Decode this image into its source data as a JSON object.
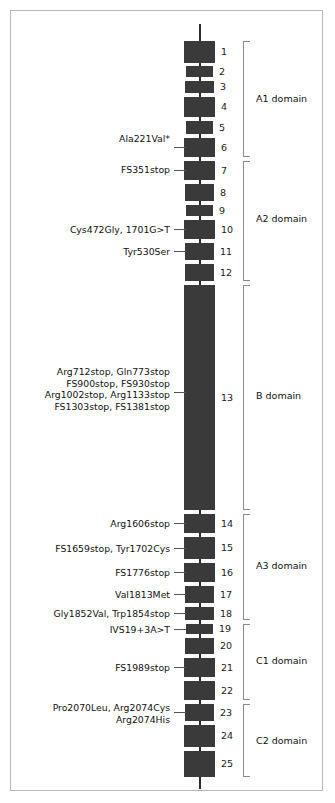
{
  "figure": {
    "backbone_color": "#2b2b2b",
    "exon_color": "#3a3a3a",
    "bracket_color": "#8a8a8a",
    "frame_color": "#b8b8b8"
  },
  "exons": [
    {
      "number": "1",
      "top": 41,
      "height": 22,
      "left": 184,
      "width": 31
    },
    {
      "number": "2",
      "top": 66,
      "height": 11,
      "left": 186,
      "width": 27
    },
    {
      "number": "3",
      "top": 81,
      "height": 12,
      "left": 185,
      "width": 29
    },
    {
      "number": "4",
      "top": 97,
      "height": 20,
      "left": 184,
      "width": 31
    },
    {
      "number": "5",
      "top": 121,
      "height": 13,
      "left": 186,
      "width": 27
    },
    {
      "number": "6",
      "top": 138,
      "height": 19,
      "left": 184,
      "width": 31
    },
    {
      "number": "7",
      "top": 161,
      "height": 19,
      "left": 184,
      "width": 31
    },
    {
      "number": "8",
      "top": 184,
      "height": 17,
      "left": 185,
      "width": 29
    },
    {
      "number": "9",
      "top": 205,
      "height": 11,
      "left": 186,
      "width": 27
    },
    {
      "number": "10",
      "top": 220,
      "height": 19,
      "left": 184,
      "width": 31
    },
    {
      "number": "11",
      "top": 243,
      "height": 17,
      "left": 185,
      "width": 29
    },
    {
      "number": "12",
      "top": 264,
      "height": 17,
      "left": 185,
      "width": 29
    },
    {
      "number": "13",
      "top": 285,
      "height": 225,
      "left": 184,
      "width": 31
    },
    {
      "number": "14",
      "top": 514,
      "height": 19,
      "left": 184,
      "width": 31
    },
    {
      "number": "15",
      "top": 537,
      "height": 22,
      "left": 184,
      "width": 31
    },
    {
      "number": "16",
      "top": 563,
      "height": 19,
      "left": 184,
      "width": 31
    },
    {
      "number": "17",
      "top": 586,
      "height": 17,
      "left": 185,
      "width": 29
    },
    {
      "number": "18",
      "top": 607,
      "height": 13,
      "left": 185,
      "width": 29
    },
    {
      "number": "19",
      "top": 624,
      "height": 10,
      "left": 186,
      "width": 27
    },
    {
      "number": "20",
      "top": 638,
      "height": 16,
      "left": 185,
      "width": 29
    },
    {
      "number": "21",
      "top": 658,
      "height": 19,
      "left": 184,
      "width": 31
    },
    {
      "number": "22",
      "top": 681,
      "height": 19,
      "left": 184,
      "width": 31
    },
    {
      "number": "23",
      "top": 704,
      "height": 17,
      "left": 185,
      "width": 29
    },
    {
      "number": "24",
      "top": 725,
      "height": 22,
      "left": 184,
      "width": 31
    },
    {
      "number": "25",
      "top": 751,
      "height": 26,
      "left": 184,
      "width": 31
    }
  ],
  "mutations": [
    {
      "lines": [
        "Ala221Val*"
      ],
      "label_top": 133,
      "leader_y": 147,
      "exon": "6"
    },
    {
      "lines": [
        "FS351stop"
      ],
      "label_top": 164,
      "leader_y": 170,
      "exon": "7"
    },
    {
      "lines": [
        "Cys472Gly, 1701G>T"
      ],
      "label_top": 224,
      "leader_y": 229,
      "exon": "10"
    },
    {
      "lines": [
        "Tyr530Ser"
      ],
      "label_top": 246,
      "leader_y": 251,
      "exon": "11"
    },
    {
      "lines": [
        "Arg712stop, Gln773stop",
        "FS900stop, FS930stop",
        "Arg1002stop, Arg1133stop",
        "FS1303stop, FS1381stop"
      ],
      "label_top": 366,
      "leader_y": 392,
      "exon": "13"
    },
    {
      "lines": [
        "Arg1606stop"
      ],
      "label_top": 518,
      "leader_y": 523,
      "exon": "14"
    },
    {
      "lines": [
        "FS1659stop, Tyr1702Cys"
      ],
      "label_top": 543,
      "leader_y": 548,
      "exon": "15"
    },
    {
      "lines": [
        "FS1776stop"
      ],
      "label_top": 567,
      "leader_y": 572,
      "exon": "16"
    },
    {
      "lines": [
        "Val1813Met"
      ],
      "label_top": 589,
      "leader_y": 594,
      "exon": "17"
    },
    {
      "lines": [
        "Gly1852Val, Trp1854stop"
      ],
      "label_top": 608,
      "leader_y": 613,
      "exon": "18"
    },
    {
      "lines": [
        "IVS19+3A>T"
      ],
      "label_top": 624,
      "leader_y": 629,
      "exon": "19"
    },
    {
      "lines": [
        "FS1989stop"
      ],
      "label_top": 662,
      "leader_y": 667,
      "exon": "21"
    },
    {
      "lines": [
        "Pro2070Leu, Arg2074Cys",
        "Arg2074His"
      ],
      "label_top": 702,
      "leader_y": 712,
      "exon": "23"
    }
  ],
  "domains": [
    {
      "name": "A1 domain",
      "top": 41,
      "height": 116,
      "label_top": 94,
      "exons": "1-6"
    },
    {
      "name": "A2 domain",
      "top": 161,
      "height": 120,
      "label_top": 214,
      "exons": "7-12"
    },
    {
      "name": "B domain",
      "top": 285,
      "height": 225,
      "label_top": 391,
      "exons": "13"
    },
    {
      "name": "A3 domain",
      "top": 514,
      "height": 106,
      "label_top": 561,
      "exons": "14-18"
    },
    {
      "name": "C1 domain",
      "top": 624,
      "height": 76,
      "label_top": 656,
      "exons": "19-22"
    },
    {
      "name": "C2 domain",
      "top": 704,
      "height": 73,
      "label_top": 736,
      "exons": "23-25"
    }
  ],
  "backbone": {
    "top": 24,
    "bottom": 789,
    "x": 199
  }
}
